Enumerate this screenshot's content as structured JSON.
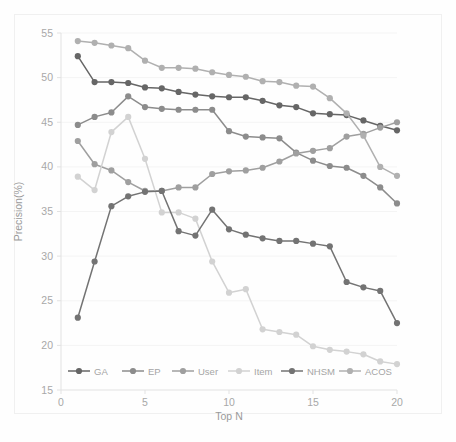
{
  "chart_data": {
    "type": "line",
    "title": "",
    "xlabel": "Top N",
    "ylabel": "Precision(%)",
    "xlim": [
      0,
      20
    ],
    "ylim": [
      15,
      55
    ],
    "xticks": [
      0,
      5,
      10,
      15,
      20
    ],
    "yticks": [
      15,
      20,
      25,
      30,
      35,
      40,
      45,
      50,
      55
    ],
    "grid": true,
    "legend_position": "bottom",
    "x": [
      1,
      2,
      3,
      4,
      5,
      6,
      7,
      8,
      9,
      10,
      11,
      12,
      13,
      14,
      15,
      16,
      17,
      18,
      19,
      20
    ],
    "series": [
      {
        "name": "GA",
        "color": "#666666",
        "values": [
          52.4,
          49.5,
          49.5,
          49.4,
          48.9,
          48.8,
          48.4,
          48.1,
          47.9,
          47.8,
          47.8,
          47.4,
          46.9,
          46.7,
          46.0,
          45.9,
          45.8,
          45.2,
          44.6,
          44.1
        ]
      },
      {
        "name": "EP",
        "color": "#8c8c8c",
        "values": [
          44.7,
          45.6,
          46.1,
          47.9,
          46.7,
          46.5,
          46.4,
          46.4,
          46.4,
          44.0,
          43.4,
          43.3,
          43.2,
          41.6,
          40.7,
          40.1,
          39.9,
          39.0,
          37.7,
          35.9
        ]
      },
      {
        "name": "User",
        "color": "#9f9f9f",
        "values": [
          42.9,
          40.3,
          39.6,
          38.3,
          37.3,
          37.3,
          37.7,
          37.7,
          39.2,
          39.5,
          39.6,
          39.9,
          40.6,
          41.5,
          41.8,
          42.1,
          43.4,
          43.7,
          44.4,
          45.0
        ]
      },
      {
        "name": "Item",
        "color": "#d2d2d2",
        "values": [
          38.9,
          37.4,
          43.9,
          45.6,
          40.9,
          34.9,
          34.9,
          34.2,
          29.4,
          25.9,
          26.3,
          21.8,
          21.5,
          21.2,
          19.9,
          19.5,
          19.3,
          19.0,
          18.2,
          17.9
        ]
      },
      {
        "name": "NHSM",
        "color": "#737373",
        "values": [
          23.1,
          29.4,
          35.6,
          36.7,
          37.2,
          37.3,
          32.8,
          32.3,
          35.2,
          33.0,
          32.4,
          32.0,
          31.7,
          31.7,
          31.4,
          31.1,
          27.1,
          26.5,
          26.1,
          22.5
        ]
      },
      {
        "name": "ACOS",
        "color": "#b0b0b0",
        "values": [
          54.1,
          53.9,
          53.6,
          53.3,
          51.9,
          51.1,
          51.1,
          51.0,
          50.6,
          50.3,
          50.1,
          49.6,
          49.5,
          49.1,
          49.0,
          47.7,
          46.0,
          43.5,
          40.0,
          39.0
        ]
      }
    ]
  },
  "legend": {
    "items": [
      {
        "label": "GA"
      },
      {
        "label": "EP"
      },
      {
        "label": "User"
      },
      {
        "label": "Item"
      },
      {
        "label": "NHSM"
      },
      {
        "label": "ACOS"
      }
    ]
  }
}
